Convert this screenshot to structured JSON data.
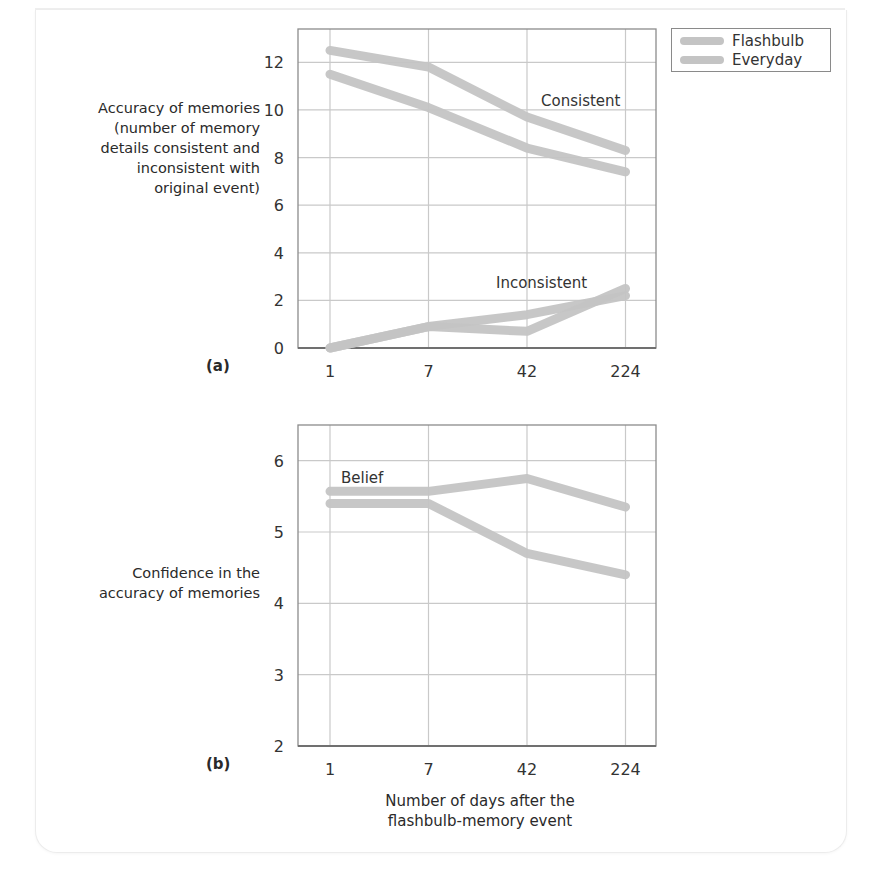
{
  "legend": {
    "items": [
      {
        "label": "Flashbulb",
        "color": "#c4c4c4"
      },
      {
        "label": "Everyday",
        "color": "#c4c4c4"
      }
    ]
  },
  "panel_a": {
    "tag": "(a)",
    "ylabel_lines": [
      "Accuracy of memories",
      "(number of memory",
      "details consistent and",
      "inconsistent with",
      "original event)"
    ],
    "annotations": {
      "consistent": "Consistent",
      "inconsistent": "Inconsistent"
    }
  },
  "panel_b": {
    "tag": "(b)",
    "ylabel_lines": [
      "Confidence in the",
      "accuracy of memories"
    ],
    "annotations": {
      "belief": "Belief"
    }
  },
  "xlabel_lines": [
    "Number of days after the",
    "flashbulb-memory event"
  ],
  "chart_data": [
    {
      "type": "line",
      "title": "(a)",
      "categories": [
        "1",
        "7",
        "42",
        "224"
      ],
      "xlabel": "",
      "ylabel": "Accuracy of memories (number of memory details consistent and inconsistent with original event)",
      "ylim": [
        0,
        13.4
      ],
      "yticks": [
        0,
        2,
        4,
        6,
        8,
        10,
        12
      ],
      "grid": true,
      "legend_position": "top-right outside",
      "line_color": "#c4c4c4",
      "series": [
        {
          "name": "Consistent (upper line)",
          "values": [
            12.5,
            11.8,
            9.7,
            8.3
          ]
        },
        {
          "name": "Consistent (lower line)",
          "values": [
            11.5,
            10.1,
            8.4,
            7.4
          ]
        },
        {
          "name": "Inconsistent (line 1)",
          "values": [
            0,
            0.9,
            1.4,
            2.2
          ]
        },
        {
          "name": "Inconsistent (line 2)",
          "values": [
            0,
            0.9,
            0.7,
            2.5
          ]
        }
      ],
      "annotations": [
        "Consistent",
        "Inconsistent"
      ]
    },
    {
      "type": "line",
      "title": "(b)",
      "categories": [
        "1",
        "7",
        "42",
        "224"
      ],
      "xlabel": "Number of days after the flashbulb-memory event",
      "ylabel": "Confidence in the accuracy of memories",
      "ylim": [
        2,
        6.5
      ],
      "yticks": [
        2,
        3,
        4,
        5,
        6
      ],
      "grid": true,
      "line_color": "#c4c4c4",
      "series": [
        {
          "name": "Belief (upper line)",
          "values": [
            5.57,
            5.57,
            5.75,
            5.35
          ]
        },
        {
          "name": "Belief (lower line)",
          "values": [
            5.4,
            5.4,
            4.7,
            4.4
          ]
        }
      ],
      "annotations": [
        "Belief"
      ]
    }
  ]
}
